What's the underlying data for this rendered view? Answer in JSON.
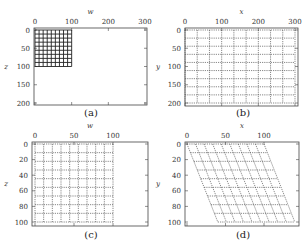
{
  "panels": [
    {
      "id": "a",
      "caption": "(a)",
      "xlabel": "w",
      "ylabel": "z",
      "xticks": [
        "0",
        "100",
        "200",
        "300"
      ],
      "yticks": [
        "0",
        "50",
        "100",
        "150",
        "200"
      ],
      "xrange": [
        0,
        300
      ],
      "yrange": [
        0,
        200
      ],
      "grid": {
        "style": "solid",
        "x0": 0,
        "x1": 100,
        "y0": 0,
        "y1": 100,
        "cols": 9,
        "rows": 9,
        "color": "#222222"
      }
    },
    {
      "id": "b",
      "caption": "(b)",
      "xlabel": "x",
      "ylabel": "y",
      "xticks": [
        "0",
        "100",
        "200",
        "300"
      ],
      "yticks": [
        "0",
        "50",
        "100",
        "150",
        "200"
      ],
      "xrange": [
        0,
        300
      ],
      "yrange": [
        0,
        200
      ],
      "grid": {
        "style": "dotted",
        "x0": 0,
        "x1": 300,
        "y0": 0,
        "y1": 200,
        "cols": 9,
        "rows": 9,
        "color": "#555555"
      }
    },
    {
      "id": "c",
      "caption": "(c)",
      "xlabel": "w",
      "ylabel": "z",
      "xticks": [
        "0",
        "50",
        "100"
      ],
      "yticks": [
        "0",
        "20",
        "40",
        "60",
        "80",
        "100"
      ],
      "xrange": [
        0,
        150
      ],
      "yrange": [
        0,
        100
      ],
      "grid": {
        "style": "dotted",
        "x0": 0,
        "x1": 100,
        "y0": 0,
        "y1": 100,
        "cols": 9,
        "rows": 9,
        "color": "#555555"
      }
    },
    {
      "id": "d",
      "caption": "(d)",
      "xlabel": "x",
      "ylabel": "y",
      "xticks": [
        "0",
        "50",
        "100"
      ],
      "yticks": [
        "0",
        "20",
        "40",
        "60",
        "80",
        "100"
      ],
      "xrange": [
        0,
        150
      ],
      "yrange": [
        0,
        100
      ],
      "grid": {
        "style": "dotted-sheared",
        "x0": 0,
        "x1": 100,
        "y0": 0,
        "y1": 100,
        "shear": 0.4,
        "cols": 9,
        "rows": 9,
        "color": "#555555"
      }
    }
  ]
}
